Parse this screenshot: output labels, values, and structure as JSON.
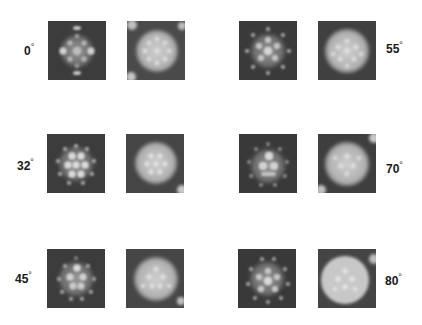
{
  "figure": {
    "rows": [
      {
        "left": {
          "angle": "0",
          "unit": "°",
          "tiles": [
            "computed-projection",
            "micrograph"
          ]
        },
        "right": {
          "angle": "55",
          "unit": "°",
          "tiles": [
            "computed-projection",
            "micrograph"
          ]
        }
      },
      {
        "left": {
          "angle": "32",
          "unit": "°",
          "tiles": [
            "computed-projection",
            "micrograph"
          ]
        },
        "right": {
          "angle": "70",
          "unit": "°",
          "tiles": [
            "computed-projection",
            "micrograph"
          ]
        }
      },
      {
        "left": {
          "angle": "45",
          "unit": "°",
          "tiles": [
            "computed-projection",
            "micrograph"
          ]
        },
        "right": {
          "angle": "80",
          "unit": "°",
          "tiles": [
            "computed-projection",
            "micrograph"
          ]
        }
      }
    ],
    "colors": {
      "background": "#ffffff",
      "tile_dark": "#3a3a3a",
      "tile_light": "#d8d8d8",
      "label": "#1a1a1a"
    }
  }
}
